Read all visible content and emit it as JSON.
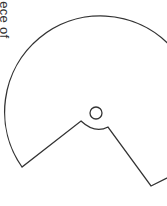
{
  "caption": {
    "text": "iece of",
    "orientation": "rotated-90-clockwise"
  },
  "figure": {
    "stroke_color": "#333333",
    "fill_color": "#ffffff"
  }
}
